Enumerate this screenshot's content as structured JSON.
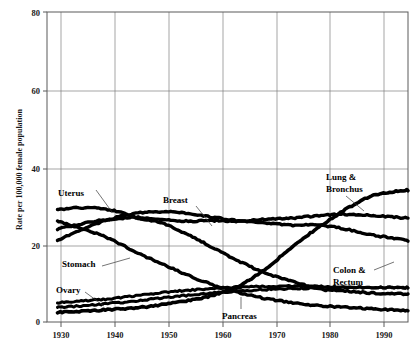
{
  "chart_data": {
    "type": "line",
    "title": "",
    "subtitle": "",
    "xlabel": "",
    "ylabel": "Rate per 100,000 female population",
    "xlim": [
      1928,
      1997
    ],
    "ylim": [
      0,
      80
    ],
    "grid": true,
    "legend_position": "inline-annotations",
    "x_ticks": [
      "1930",
      "1940",
      "1950",
      "1960",
      "1970",
      "1980",
      "1990"
    ],
    "x_tick_values": [
      1930,
      1940,
      1950,
      1960,
      1970,
      1980,
      1990
    ],
    "y_ticks": [
      "0",
      "20",
      "40",
      "60",
      "80"
    ],
    "y_tick_values": [
      0,
      20,
      40,
      60,
      80
    ],
    "x": [
      1930,
      1935,
      1940,
      1945,
      1950,
      1955,
      1960,
      1965,
      1970,
      1975,
      1980,
      1985,
      1990,
      1995,
      1997
    ],
    "series": [
      {
        "name": "Lung & Bronchus",
        "label": "Lung & Bronchus",
        "label_lines": [
          "Lung &",
          "Bronchus"
        ],
        "color": "#000000",
        "values": [
          2.5,
          2.8,
          3.2,
          3.6,
          4.5,
          5.5,
          7.0,
          9.5,
          14.0,
          19.5,
          24.5,
          29.0,
          32.5,
          33.8,
          34.0
        ]
      },
      {
        "name": "Breast",
        "label": "Breast",
        "label_lines": [
          "Breast"
        ],
        "color": "#000000",
        "values": [
          24.0,
          25.5,
          26.5,
          27.0,
          26.5,
          26.0,
          26.2,
          26.0,
          26.5,
          26.8,
          27.5,
          27.8,
          27.5,
          27.0,
          26.8
        ]
      },
      {
        "name": "Colon & Rectum",
        "label": "Colon & Rectum",
        "label_lines": [
          "Colon &",
          "Rectum"
        ],
        "color": "#000000",
        "values": [
          21.0,
          24.0,
          26.5,
          28.0,
          28.5,
          28.0,
          27.0,
          26.0,
          25.5,
          25.0,
          25.0,
          24.0,
          22.5,
          21.5,
          21.0
        ]
      },
      {
        "name": "Uterus",
        "label": "Uterus",
        "label_lines": [
          "Uterus"
        ],
        "color": "#000000",
        "values": [
          29.0,
          29.5,
          29.0,
          27.0,
          25.5,
          22.5,
          19.0,
          15.5,
          12.5,
          10.5,
          8.5,
          8.0,
          7.5,
          7.3,
          7.2
        ]
      },
      {
        "name": "Stomach",
        "label": "Stomach",
        "label_lines": [
          "Stomach"
        ],
        "color": "#000000",
        "values": [
          26.0,
          24.0,
          21.5,
          18.0,
          15.0,
          12.0,
          9.5,
          7.5,
          6.0,
          5.0,
          4.2,
          3.8,
          3.4,
          3.1,
          3.0
        ]
      },
      {
        "name": "Ovary",
        "label": "Ovary",
        "label_lines": [
          "Ovary"
        ],
        "color": "#000000",
        "values": [
          5.0,
          5.5,
          6.0,
          6.8,
          7.6,
          8.2,
          8.6,
          9.0,
          9.2,
          9.3,
          9.2,
          9.0,
          8.9,
          8.8,
          8.8
        ]
      },
      {
        "name": "Pancreas",
        "label": "Pancreas",
        "label_lines": [
          "Pancreas"
        ],
        "color": "#000000",
        "values": [
          3.8,
          4.2,
          4.8,
          5.4,
          6.2,
          6.9,
          7.5,
          8.0,
          8.4,
          8.6,
          8.8,
          8.9,
          8.9,
          8.9,
          8.9
        ]
      }
    ],
    "annotations": [
      {
        "text": "Uterus",
        "x": 1932,
        "y": 36
      },
      {
        "text": "Breast",
        "x": 1951,
        "y": 34
      },
      {
        "text": "Stomach",
        "x": 1933,
        "y": 17
      },
      {
        "text": "Ovary",
        "x": 1932,
        "y": 10
      },
      {
        "text": "Pancreas",
        "x": 1961,
        "y": 2
      },
      {
        "text": "Lung & Bronchus",
        "x": 1980,
        "y": 40
      },
      {
        "text": "Colon & Rectum",
        "x": 1981,
        "y": 15
      }
    ]
  },
  "axis": {
    "y_title": "Rate per 100,000 female population",
    "y_tick_0": "0",
    "y_tick_20": "20",
    "y_tick_40": "40",
    "y_tick_60": "60",
    "y_tick_80": "80",
    "x_tick_1930": "1930",
    "x_tick_1940": "1940",
    "x_tick_1950": "1950",
    "x_tick_1960": "1960",
    "x_tick_1970": "1970",
    "x_tick_1980": "1980",
    "x_tick_1990": "1990"
  },
  "labels": {
    "uterus": "Uterus",
    "breast": "Breast",
    "stomach": "Stomach",
    "ovary": "Ovary",
    "pancreas": "Pancreas",
    "lung_line1": "Lung &",
    "lung_line2": "Bronchus",
    "colon_line1": "Colon &",
    "colon_line2": "Rectum"
  }
}
